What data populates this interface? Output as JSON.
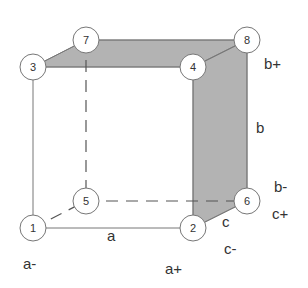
{
  "diagram": {
    "type": "cube-factorial-design",
    "colors": {
      "shade": "#b3b3b3",
      "edge": "#777777",
      "circle_stroke": "#777777",
      "circle_fill": "#ffffff",
      "text": "#333333"
    },
    "nodes": [
      {
        "id": "1",
        "x": 33,
        "y": 228
      },
      {
        "id": "2",
        "x": 193,
        "y": 228
      },
      {
        "id": "3",
        "x": 33,
        "y": 67
      },
      {
        "id": "4",
        "x": 193,
        "y": 67
      },
      {
        "id": "5",
        "x": 86,
        "y": 201
      },
      {
        "id": "6",
        "x": 247,
        "y": 201
      },
      {
        "id": "7",
        "x": 86,
        "y": 40
      },
      {
        "id": "8",
        "x": 247,
        "y": 40
      }
    ],
    "labels": {
      "a": "a",
      "a_minus": "a-",
      "a_plus": "a+",
      "b": "b",
      "b_minus": "b-",
      "b_plus": "b+",
      "c": "c",
      "c_minus": "c-",
      "c_plus": "c+"
    }
  }
}
